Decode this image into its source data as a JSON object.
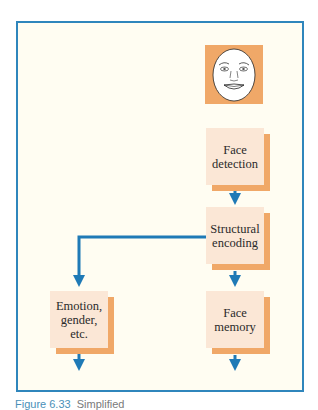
{
  "diagram": {
    "title_icon": "face-icon",
    "nodes": [
      {
        "id": "face_detection",
        "label_lines": [
          "Face",
          "detection"
        ]
      },
      {
        "id": "structural_encoding",
        "label_lines": [
          "Structural",
          "encoding"
        ]
      },
      {
        "id": "emotion",
        "label_lines": [
          "Emotion,",
          "gender,",
          "etc."
        ]
      },
      {
        "id": "face_memory",
        "label_lines": [
          "Face",
          "memory"
        ]
      }
    ],
    "edges": [
      {
        "from": "face_detection",
        "to": "structural_encoding"
      },
      {
        "from": "structural_encoding",
        "to": "emotion"
      },
      {
        "from": "structural_encoding",
        "to": "face_memory"
      },
      {
        "from": "emotion",
        "to": "output"
      },
      {
        "from": "face_memory",
        "to": "output"
      }
    ],
    "colors": {
      "frame": "#2f86bc",
      "background": "#fffdf2",
      "box_fill": "#fbe7d6",
      "box_shadow": "#f0a868",
      "arrow": "#1f7ab6"
    }
  },
  "caption": {
    "figure_label": "Figure 6.33",
    "text": "Simplified"
  }
}
